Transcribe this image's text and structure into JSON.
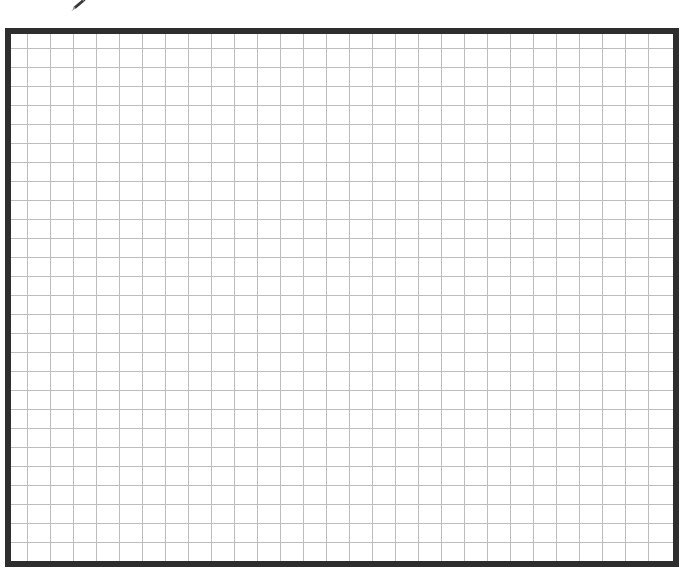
{
  "canvas": {
    "background_color": "#ffffff",
    "label": "Graph paper grid"
  },
  "cursor": {
    "icon": "pencil-icon",
    "color": "#3a3a3a"
  },
  "grid": {
    "border_color": "#2e2e2e",
    "line_color": "#bdbdbd",
    "columns": 29,
    "rows": 27,
    "cell_width_px": 23,
    "cell_height_px": 19
  }
}
